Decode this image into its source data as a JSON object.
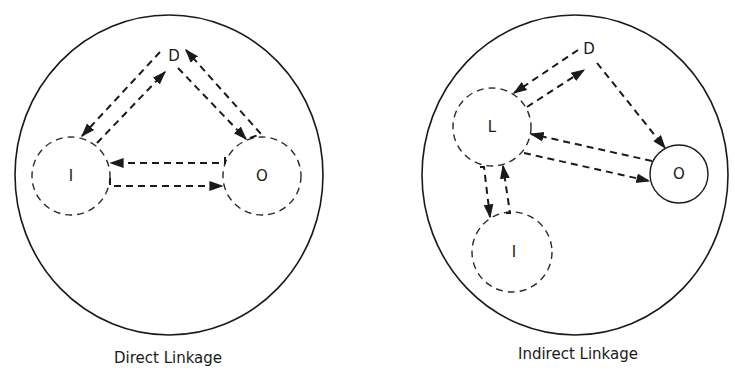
{
  "diagrams": [
    {
      "caption": "Direct Linkage",
      "nodes": {
        "D": {
          "label": "D"
        },
        "I": {
          "label": "I"
        },
        "O": {
          "label": "O"
        }
      },
      "links": [
        {
          "from": "D",
          "to": "I"
        },
        {
          "from": "I",
          "to": "D"
        },
        {
          "from": "D",
          "to": "O"
        },
        {
          "from": "O",
          "to": "D"
        },
        {
          "from": "O",
          "to": "I"
        },
        {
          "from": "I",
          "to": "O"
        }
      ]
    },
    {
      "caption": "Indirect Linkage",
      "nodes": {
        "D": {
          "label": "D"
        },
        "L": {
          "label": "L"
        },
        "I": {
          "label": "I"
        },
        "O": {
          "label": "O"
        }
      },
      "links": [
        {
          "from": "D",
          "to": "L"
        },
        {
          "from": "L",
          "to": "D"
        },
        {
          "from": "D",
          "to": "O"
        },
        {
          "from": "O",
          "to": "L"
        },
        {
          "from": "L",
          "to": "O"
        },
        {
          "from": "L",
          "to": "I"
        },
        {
          "from": "I",
          "to": "L"
        }
      ]
    }
  ],
  "colors": {
    "ink": "#1a1a1a",
    "background": "#ffffff"
  }
}
